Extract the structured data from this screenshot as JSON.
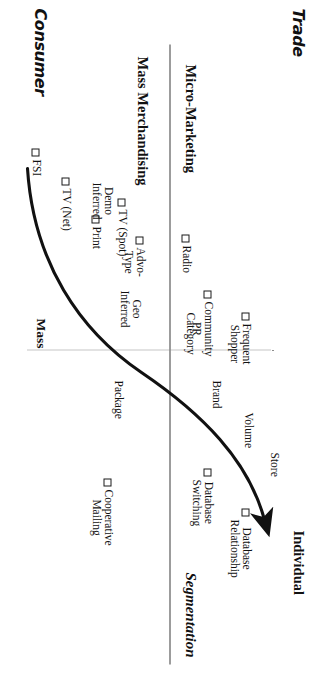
{
  "diagram": {
    "axes": {
      "top_left_corner": "Trade",
      "bottom_left_corner": "Consumer",
      "upper_left_quadrant": "Micro-Marketing",
      "lower_left_quadrant": "Mass Merchandising",
      "bottom_axis_left": "Mass",
      "top_axis_right": "Individual",
      "arrow_caption": "Segmentation"
    },
    "marker_items": [
      {
        "id": "fsi",
        "label": "FSI"
      },
      {
        "id": "tv-net",
        "label": "TV (Net)"
      },
      {
        "id": "print",
        "label": "Print"
      },
      {
        "id": "tv-spot",
        "label": "TV (Spot)"
      },
      {
        "id": "advo-type",
        "label": "Advo-\nType"
      },
      {
        "id": "radio",
        "label": "Radio"
      },
      {
        "id": "community-pr",
        "label": "Community\nPR"
      },
      {
        "id": "frequent-shopper",
        "label": "Frequent\nShopper"
      },
      {
        "id": "database-switching",
        "label": "Database\nSwitching"
      },
      {
        "id": "database-relationship",
        "label": "Database\nRelationship"
      },
      {
        "id": "cooperative-mailing",
        "label": "Cooperative\nMailing"
      }
    ],
    "curve_notes": [
      {
        "id": "demo-inferred",
        "label": "Demo\nInferred"
      },
      {
        "id": "geo-inferred",
        "label": "Geo\nInferred"
      },
      {
        "id": "category",
        "label": "Category"
      },
      {
        "id": "package",
        "label": "Package"
      },
      {
        "id": "brand",
        "label": "Brand"
      },
      {
        "id": "volume",
        "label": "Volume"
      },
      {
        "id": "store",
        "label": "Store"
      }
    ],
    "colors": {
      "ink": "#111111",
      "axis": "#3a3a3a",
      "dotted": "#8d8d8d",
      "background": "#ffffff"
    }
  }
}
